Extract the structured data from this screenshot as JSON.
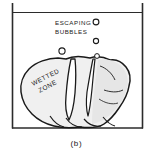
{
  "figure": {
    "caption": "(b)",
    "annotations": {
      "bubbles_label_line1": "ESCAPING",
      "bubbles_label_line2": "BUBBLES",
      "zone_label_line1": "WETTED",
      "zone_label_line2": "ZONE"
    },
    "colors": {
      "background": "#ffffff",
      "ink": "#1a1a1a",
      "specimen_fill": "#f0f0f0",
      "specimen_shade": "#e4e4e4",
      "container_line": "#2b2b2b"
    },
    "container": {
      "left_wall_x": 12,
      "right_wall_x": 143,
      "top_y": 3,
      "floor_y": 128,
      "liquid_surface_y": 12
    },
    "bubbles": [
      {
        "cx": 96,
        "cy": 22,
        "r": 2.9
      },
      {
        "cx": 96,
        "cy": 41,
        "r": 2.6
      },
      {
        "cx": 62,
        "cy": 51,
        "r": 3.1
      },
      {
        "cx": 97,
        "cy": 56,
        "r": 2.4
      }
    ]
  }
}
